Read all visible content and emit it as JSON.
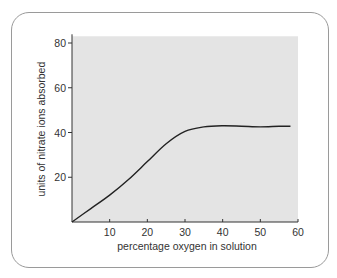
{
  "chart_data": {
    "type": "line",
    "title": "",
    "xlabel": "percentage oxygen in solution",
    "ylabel": "units of nitrate ions absorbed",
    "xlim": [
      0,
      60
    ],
    "ylim": [
      0,
      83
    ],
    "xticks": [
      10,
      20,
      30,
      40,
      50,
      60
    ],
    "yticks": [
      20,
      40,
      60,
      80
    ],
    "grid": false,
    "legend": null,
    "series": [
      {
        "name": "nitrate uptake",
        "x": [
          0,
          5,
          10,
          15,
          20,
          25,
          30,
          35,
          40,
          45,
          50,
          55,
          58
        ],
        "y": [
          0,
          6,
          12,
          19,
          27,
          35,
          40.5,
          42.5,
          43,
          42.8,
          42.5,
          42.8,
          42.8
        ]
      }
    ]
  },
  "colors": {
    "plot_background": "#e4e4e4",
    "line": "#222222",
    "card_border": "#9a9a9a"
  }
}
